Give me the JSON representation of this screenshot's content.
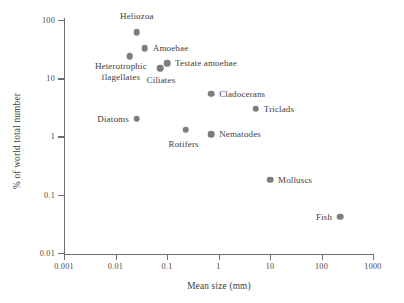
{
  "chart_data": {
    "type": "scatter",
    "title": "",
    "xlabel": "Mean size (mm)",
    "ylabel": "% of world total number",
    "xscale": "log",
    "yscale": "log",
    "xlim": [
      0.001,
      1000
    ],
    "ylim": [
      0.01,
      100
    ],
    "grid": false,
    "legend": "none",
    "xticks": [
      "0.001",
      "0.01",
      "0.1",
      "1",
      "10",
      "100",
      "1000"
    ],
    "xtick_values": [
      0.001,
      0.01,
      0.1,
      1,
      10,
      100,
      1000
    ],
    "yticks": [
      "100",
      "10",
      "1",
      "0.1",
      "0.01"
    ],
    "ytick_values": [
      100,
      10,
      1,
      0.1,
      0.01
    ],
    "marker_color": "#7d7d7d",
    "axis_color": "#6e6e6e",
    "points": [
      {
        "label": "Heliozoa",
        "x": 0.026,
        "y": 62,
        "label_anchor": "middle",
        "label_dx": 0,
        "label_dy": -16
      },
      {
        "label": "Amoebae",
        "x": 0.037,
        "y": 33,
        "label_anchor": "start",
        "label_dx": 8,
        "label_dy": 0
      },
      {
        "label": "Heterotrophic\nflagellates",
        "x": 0.019,
        "y": 24,
        "label_anchor": "middle",
        "label_dx": -9,
        "label_dy": 16
      },
      {
        "label": "Testate amoebae",
        "x": 0.1,
        "y": 18,
        "label_anchor": "start",
        "label_dx": 8,
        "label_dy": 0
      },
      {
        "label": "Ciliates",
        "x": 0.073,
        "y": 15,
        "label_anchor": "middle",
        "label_dx": 1,
        "label_dy": 12
      },
      {
        "label": "Cladocerans",
        "x": 0.72,
        "y": 5.4,
        "label_anchor": "start",
        "label_dx": 8,
        "label_dy": 0
      },
      {
        "label": "Triclads",
        "x": 5.3,
        "y": 3.0,
        "label_anchor": "start",
        "label_dx": 8,
        "label_dy": 0
      },
      {
        "label": "Diatoms",
        "x": 0.026,
        "y": 2.0,
        "label_anchor": "end",
        "label_dx": -8,
        "label_dy": 0
      },
      {
        "label": "Rotifers",
        "x": 0.23,
        "y": 1.3,
        "label_anchor": "middle",
        "label_dx": -2,
        "label_dy": 14
      },
      {
        "label": "Nematodes",
        "x": 0.72,
        "y": 1.1,
        "label_anchor": "start",
        "label_dx": 8,
        "label_dy": 0
      },
      {
        "label": "Molluscs",
        "x": 10,
        "y": 0.18,
        "label_anchor": "start",
        "label_dx": 8,
        "label_dy": 0
      },
      {
        "label": "Fish",
        "x": 230,
        "y": 0.042,
        "label_anchor": "end",
        "label_dx": -8,
        "label_dy": 0
      }
    ]
  }
}
